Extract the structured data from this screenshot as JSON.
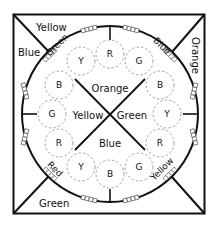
{
  "diagram": {
    "outer_corners": {
      "top": "Yellow",
      "left": "Blue",
      "right": "Orange",
      "bottom": "Green"
    },
    "rim_labels": {
      "top_left": "Green",
      "top_right": "Blue",
      "bottom_left": "Red",
      "bottom_right": "Yellow"
    },
    "center_quadrants": {
      "top": "Orange",
      "left": "Yellow",
      "right": "Green",
      "bottom": "Blue"
    },
    "ring_circles": [
      {
        "pos": "top-1",
        "label": "Y"
      },
      {
        "pos": "top-2",
        "label": "R"
      },
      {
        "pos": "top-3",
        "label": "G"
      },
      {
        "pos": "right-1",
        "label": "B"
      },
      {
        "pos": "right-2",
        "label": "Y"
      },
      {
        "pos": "right-3",
        "label": "R"
      },
      {
        "pos": "bottom-1",
        "label": "G"
      },
      {
        "pos": "bottom-2",
        "label": "B"
      },
      {
        "pos": "bottom-3",
        "label": "Y"
      },
      {
        "pos": "left-1",
        "label": "R"
      },
      {
        "pos": "left-2",
        "label": "G"
      },
      {
        "pos": "left-3",
        "label": "B"
      }
    ],
    "colors": {
      "line": "#111111",
      "dashed_circle": "#999999",
      "background": "#ffffff"
    }
  }
}
